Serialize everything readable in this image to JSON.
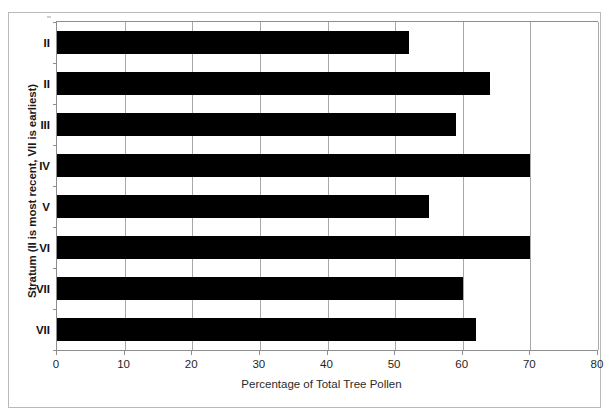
{
  "chart_data": {
    "type": "bar",
    "orientation": "horizontal",
    "title": "",
    "subtitle": "",
    "xlabel": "Percentage of Total Tree Pollen",
    "ylabel": "Stratum (II is most recent, VII is earliest)",
    "categories": [
      "II",
      "II",
      "III",
      "IV",
      "V",
      "VI",
      "VII",
      "VII"
    ],
    "values": [
      52,
      64,
      59,
      70,
      55,
      70,
      60,
      62
    ],
    "xlim": [
      0,
      80
    ],
    "xticks": [
      0,
      10,
      20,
      30,
      40,
      50,
      60,
      70,
      80
    ],
    "xtick_labels": [
      "0",
      "10",
      "20",
      "30",
      "40",
      "50",
      "60",
      "70",
      "80"
    ],
    "grid": "vertical",
    "legend": "none",
    "bar_color": "#000000",
    "plot_background": "#ffffff",
    "gridline_color": "#a8a8a8",
    "axis_color": "#8d8d8d",
    "frame_color": "#b9b9b9",
    "annotations": []
  }
}
